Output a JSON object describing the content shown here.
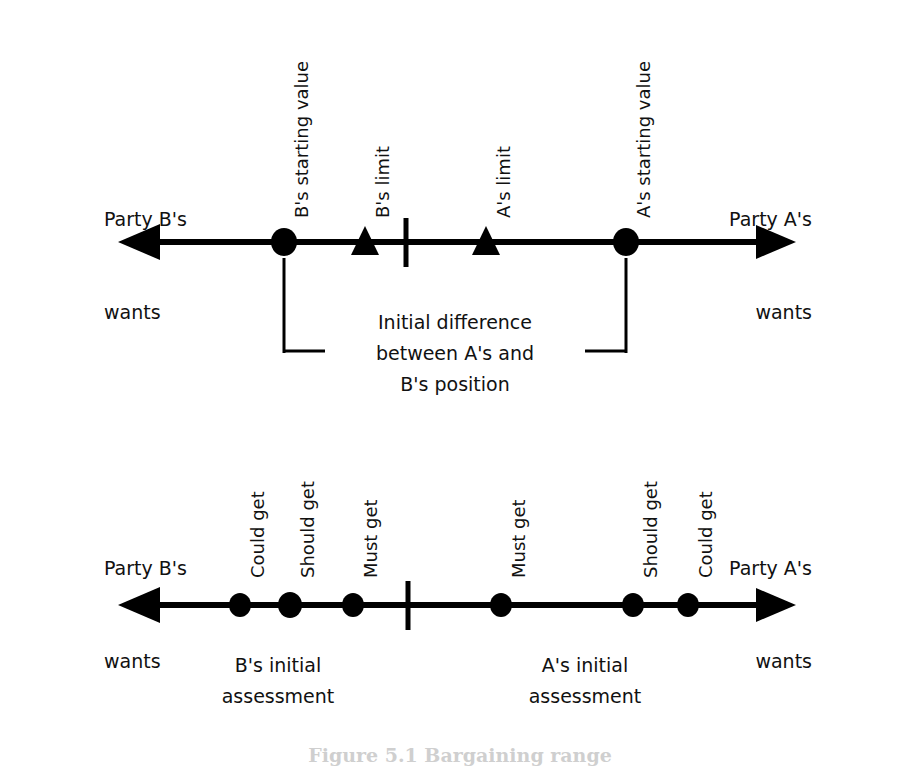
{
  "figure": {
    "caption": "Figure 5.1  Bargaining range",
    "background": "#ffffff",
    "ink": "#000000"
  },
  "diagram_top": {
    "left_party": {
      "line1": "Party B's",
      "line2": "wants"
    },
    "right_party": {
      "line1": "Party A's",
      "line2": "wants"
    },
    "markers": [
      {
        "id": "b-start",
        "label": "B's starting value",
        "shape": "circle",
        "x": 284
      },
      {
        "id": "b-limit",
        "label": "B's limit",
        "shape": "triangle",
        "x": 365
      },
      {
        "id": "midpoint",
        "label": "",
        "shape": "tick",
        "x": 406
      },
      {
        "id": "a-limit",
        "label": "A's limit",
        "shape": "triangle",
        "x": 486
      },
      {
        "id": "a-start",
        "label": "A's starting value",
        "shape": "circle",
        "x": 626
      }
    ],
    "bracket": {
      "line1": "Initial difference",
      "line2": "between A's and",
      "line3": "B's position",
      "from_x": 284,
      "to_x": 626
    }
  },
  "diagram_bottom": {
    "left_party": {
      "line1": "Party B's",
      "line2": "wants"
    },
    "right_party": {
      "line1": "Party A's",
      "line2": "wants"
    },
    "markers": [
      {
        "id": "b-could",
        "label": "Could get",
        "shape": "circle",
        "x": 240
      },
      {
        "id": "b-should",
        "label": "Should get",
        "shape": "circle",
        "x": 290
      },
      {
        "id": "b-must",
        "label": "Must get",
        "shape": "circle",
        "x": 353
      },
      {
        "id": "midpoint",
        "label": "",
        "shape": "tick",
        "x": 408
      },
      {
        "id": "a-must",
        "label": "Must get",
        "shape": "circle",
        "x": 501
      },
      {
        "id": "a-should",
        "label": "Should get",
        "shape": "circle",
        "x": 633
      },
      {
        "id": "a-could",
        "label": "Could get",
        "shape": "circle",
        "x": 688
      }
    ],
    "assessment_b": {
      "line1": "B's initial",
      "line2": "assessment"
    },
    "assessment_a": {
      "line1": "A's initial",
      "line2": "assessment"
    }
  }
}
